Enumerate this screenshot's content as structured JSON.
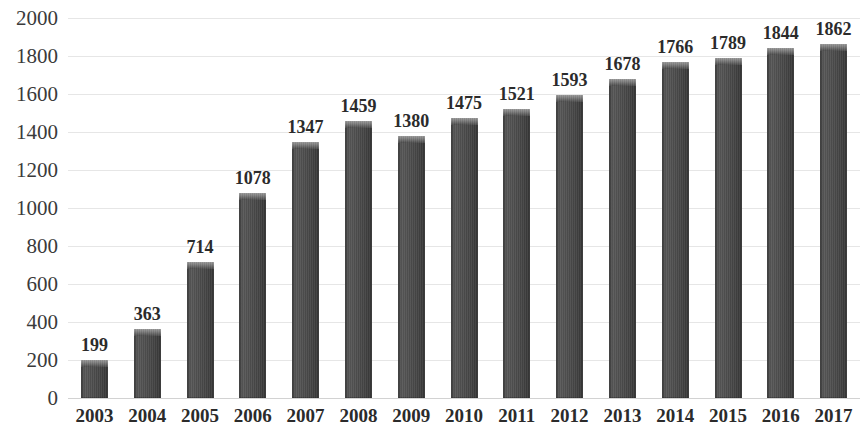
{
  "chart_data": {
    "type": "bar",
    "title": "",
    "subtitle": "",
    "xlabel": "",
    "ylabel": "",
    "categories": [
      "2003",
      "2004",
      "2005",
      "2006",
      "2007",
      "2008",
      "2009",
      "2010",
      "2011",
      "2012",
      "2013",
      "2014",
      "2015",
      "2016",
      "2017"
    ],
    "values": [
      199,
      363,
      714,
      1078,
      1347,
      1459,
      1380,
      1475,
      1521,
      1593,
      1678,
      1766,
      1789,
      1844,
      1862
    ],
    "data_labels": [
      "199",
      "363",
      "714",
      "1078",
      "1347",
      "1459",
      "1380",
      "1475",
      "1521",
      "1593",
      "1678",
      "1766",
      "1789",
      "1844",
      "1862"
    ],
    "ylim": [
      0,
      2000
    ],
    "y_ticks": [
      0,
      200,
      400,
      600,
      800,
      1000,
      1200,
      1400,
      1600,
      1800,
      2000
    ],
    "y_tick_labels": [
      "0",
      "200",
      "400",
      "600",
      "800",
      "1000",
      "1200",
      "1400",
      "1600",
      "1800",
      "2000"
    ],
    "grid": true,
    "grid_axis": "y",
    "legend": false,
    "legend_position": "none",
    "series": [
      {
        "name": "",
        "values": [
          199,
          363,
          714,
          1078,
          1347,
          1459,
          1380,
          1475,
          1521,
          1593,
          1678,
          1766,
          1789,
          1844,
          1862
        ]
      }
    ],
    "colors": {
      "bar_fill": "#4e4e4e",
      "bar_fill_dark": "#363636",
      "bar_bevel": "#8f8f8f",
      "gridline": "#e6e6e6",
      "baseline": "#d2d2d2",
      "text": "#2b2b2b",
      "axis_text": "#3a3a3a",
      "background": "#ffffff"
    }
  }
}
